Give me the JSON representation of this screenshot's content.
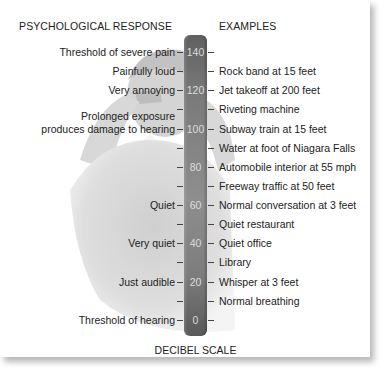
{
  "headers": {
    "left": "PSYCHOLOGICAL RESPONSE",
    "right": "EXAMPLES",
    "bottom": "DECIBEL SCALE"
  },
  "scale": {
    "min": 0,
    "max": 140,
    "step": 10,
    "labeled_step": 20,
    "bar_color_top": "#606060",
    "bar_color_mid": "#8e8e8e",
    "bar_color_bottom": "#5a5a5a"
  },
  "rows": [
    {
      "db": 140,
      "label": "140",
      "response": "Threshold of severe pain",
      "example": ""
    },
    {
      "db": 130,
      "label": "",
      "response": "Painfully loud",
      "example": "Rock band at 15 feet"
    },
    {
      "db": 120,
      "label": "120",
      "response": "Very annoying",
      "example": "Jet takeoff at 200 feet"
    },
    {
      "db": 110,
      "label": "",
      "response": "",
      "example": "Riveting machine"
    },
    {
      "db": 100,
      "label": "100",
      "response": "Prolonged exposure\nproduces damage to hearing",
      "response_line1": "Prolonged exposure",
      "response_line2": "produces damage to hearing",
      "example": "Subway train at 15 feet"
    },
    {
      "db": 90,
      "label": "",
      "response": "",
      "example": "Water at foot of Niagara Falls"
    },
    {
      "db": 80,
      "label": "80",
      "response": "",
      "example": "Automobile interior at 55 mph"
    },
    {
      "db": 70,
      "label": "",
      "response": "",
      "example": "Freeway traffic at 50 feet"
    },
    {
      "db": 60,
      "label": "60",
      "response": "Quiet",
      "example": "Normal conversation at 3 feet"
    },
    {
      "db": 50,
      "label": "",
      "response": "",
      "example": "Quiet restaurant"
    },
    {
      "db": 40,
      "label": "40",
      "response": "Very quiet",
      "example": "Quiet office"
    },
    {
      "db": 30,
      "label": "",
      "response": "",
      "example": "Library"
    },
    {
      "db": 20,
      "label": "20",
      "response": "Just audible",
      "example": "Whisper at 3 feet"
    },
    {
      "db": 10,
      "label": "",
      "response": "",
      "example": "Normal breathing"
    },
    {
      "db": 0,
      "label": "0",
      "response": "Threshold of hearing",
      "example": ""
    }
  ],
  "background_image": "faded photo of man covering ears"
}
